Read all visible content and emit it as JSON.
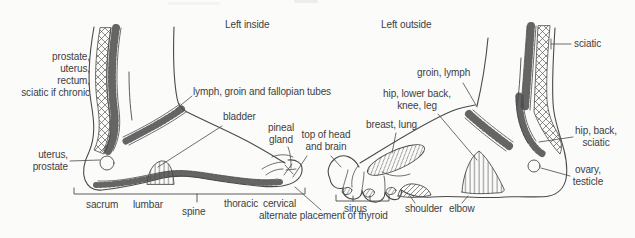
{
  "titles": {
    "left_inside": "Left inside",
    "left_outside": "Left outside"
  },
  "labels": {
    "prostate_block": "prostate,\nuterus,\nrectum,\nsciatic if chronic",
    "lymph": "lymph, groin and fallopian tubes",
    "bladder": "bladder",
    "pineal": "pineal\ngland",
    "top_head": "top of head\nand brain",
    "uterus": "uterus,\nprostate",
    "sacrum": "sacrum",
    "lumbar": "lumbar",
    "spine": "spine",
    "thoracic": "thoracic",
    "cervical": "cervical",
    "alternate": "alternate placement of thyroid",
    "sinus": "sinus",
    "shoulder": "shoulder",
    "elbow": "elbow",
    "groin": "groin, lymph",
    "hip_lower": "hip, lower back,\nknee, leg",
    "breast": "breast, lung",
    "sciatic": "sciatic",
    "hip_back": "hip, back,\nsciatic",
    "ovary": "ovary,\ntesticle"
  },
  "colors": {
    "line": "#4a4a4a",
    "text": "#3e3e3e",
    "background": "#fbfbfa"
  }
}
